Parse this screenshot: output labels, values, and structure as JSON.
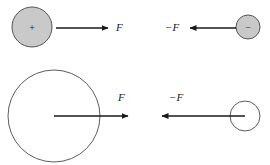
{
  "figure": {
    "background_color": "#ffffff",
    "stroke_color": "#1a1a1a",
    "circle_outline_color": "#4a4a4a",
    "filled_circle_color": "#c9c9c9",
    "panels": [
      {
        "id": "top-left",
        "body": {
          "name": "positive-charge-large",
          "charge_symbol": "+",
          "fill": "filled",
          "cx": 32,
          "cy": 27,
          "r": 20
        },
        "arrow": {
          "name": "force-arrow-right",
          "direction": "right",
          "x_start": 56,
          "x_end": 108,
          "y": 28
        },
        "label": {
          "text": "F",
          "x": 116,
          "y": 31
        }
      },
      {
        "id": "top-right",
        "body": {
          "name": "negative-charge-small",
          "charge_symbol": "−",
          "fill": "filled",
          "cx": 248,
          "cy": 27,
          "r": 12
        },
        "arrow": {
          "name": "reaction-force-arrow-left",
          "direction": "left",
          "x_start": 236,
          "x_end": 190,
          "y": 28
        },
        "label": {
          "text": "−F",
          "x": 165,
          "y": 31
        }
      },
      {
        "id": "bottom-left",
        "body": {
          "name": "large-mass-circle",
          "charge_symbol": "",
          "fill": "outline",
          "cx": 54,
          "cy": 116,
          "r": 46
        },
        "arrow": {
          "name": "force-arrow-right",
          "direction": "right",
          "x_start": 54,
          "x_end": 128,
          "y": 116
        },
        "label": {
          "text": "F",
          "x": 118,
          "y": 101
        }
      },
      {
        "id": "bottom-right",
        "body": {
          "name": "small-mass-circle",
          "charge_symbol": "",
          "fill": "outline",
          "cx": 245,
          "cy": 116,
          "r": 15
        },
        "arrow": {
          "name": "reaction-force-arrow-left",
          "direction": "left",
          "x_start": 245,
          "x_end": 162,
          "y": 116
        },
        "label": {
          "text": "−F",
          "x": 169,
          "y": 101
        }
      }
    ]
  }
}
